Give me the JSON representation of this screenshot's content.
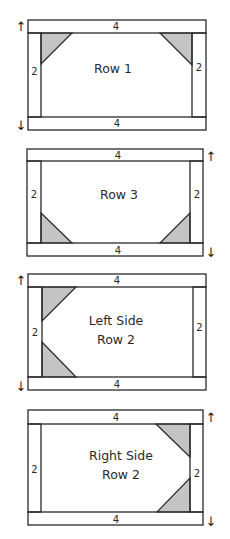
{
  "diagram": {
    "shade_color": "#c4c4c4",
    "line_color": "#2a2a2a",
    "blocks": [
      {
        "name": "row-1",
        "title_lines": [
          "Row 1"
        ],
        "top_strip_label": "4",
        "bottom_strip_label": "4",
        "left_strip_label": "2",
        "right_strip_label": "2",
        "arrow_side": "left",
        "arrow_up": "↑",
        "arrow_down": "↓",
        "corner_triangles": [
          "top-left",
          "top-right"
        ]
      },
      {
        "name": "row-3",
        "title_lines": [
          "Row 3"
        ],
        "top_strip_label": "4",
        "bottom_strip_label": "4",
        "left_strip_label": "2",
        "right_strip_label": "2",
        "arrow_side": "right",
        "arrow_up": "↑",
        "arrow_down": "↓",
        "corner_triangles": [
          "bottom-left",
          "bottom-right"
        ]
      },
      {
        "name": "left-side-row-2",
        "title_lines": [
          "Left Side",
          "Row 2"
        ],
        "top_strip_label": "4",
        "bottom_strip_label": "4",
        "left_strip_label": "2",
        "right_strip_label": "2",
        "arrow_side": "left",
        "arrow_up": "↑",
        "arrow_down": "↓",
        "corner_triangles": [
          "top-left",
          "bottom-left"
        ]
      },
      {
        "name": "right-side-row-2",
        "title_lines": [
          "Right Side",
          "Row 2"
        ],
        "top_strip_label": "4",
        "bottom_strip_label": "4",
        "left_strip_label": "2",
        "right_strip_label": "2",
        "arrow_side": "right",
        "arrow_up": "↑",
        "arrow_down": "↓",
        "corner_triangles": [
          "top-right",
          "bottom-right"
        ]
      }
    ]
  }
}
